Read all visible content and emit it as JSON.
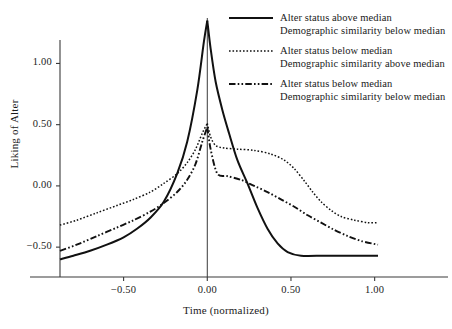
{
  "chart_data": {
    "type": "line",
    "title": "",
    "xlabel": "Time (normalized)",
    "ylabel": "Liking of Alter",
    "xlim": [
      -0.88,
      1.02
    ],
    "ylim": [
      -0.85,
      1.42
    ],
    "xticks": [
      -0.5,
      0.0,
      0.5,
      1.0
    ],
    "xticklabels": [
      "−0.50",
      "0.00",
      "0.50",
      "1.00"
    ],
    "yticks": [
      1.0,
      0.5,
      0.0,
      -0.5
    ],
    "yticklabels": [
      "1.00",
      "0.50",
      "0.00",
      "−0.50"
    ],
    "grid": false,
    "legend_position": "top-right",
    "vertical_reference_line_x": 0.0,
    "series": [
      {
        "name": "Alter status above median / Demographic similarity below median",
        "style": "solid",
        "legend_line1": "Alter status above median",
        "legend_line2": "Demographic  similarity below median",
        "x": [
          -0.88,
          -0.8,
          -0.7,
          -0.6,
          -0.5,
          -0.42,
          -0.34,
          -0.26,
          -0.18,
          -0.12,
          -0.06,
          -0.02,
          0.0,
          0.02,
          0.05,
          0.09,
          0.13,
          0.18,
          0.24,
          0.3,
          0.36,
          0.42,
          0.48,
          0.56,
          0.7,
          0.85,
          1.02
        ],
        "y": [
          -0.6,
          -0.57,
          -0.53,
          -0.48,
          -0.42,
          -0.35,
          -0.26,
          -0.13,
          0.1,
          0.36,
          0.78,
          1.18,
          1.35,
          1.12,
          0.85,
          0.62,
          0.43,
          0.21,
          0.02,
          -0.18,
          -0.35,
          -0.47,
          -0.54,
          -0.57,
          -0.57,
          -0.57,
          -0.57
        ]
      },
      {
        "name": "Alter status below median / Demographic similarity above median",
        "style": "dotted",
        "legend_line1": "Alter status below median",
        "legend_line2": "Demographic  similarity above median",
        "x": [
          -0.88,
          -0.78,
          -0.66,
          -0.54,
          -0.44,
          -0.34,
          -0.26,
          -0.18,
          -0.12,
          -0.07,
          -0.03,
          0.0,
          0.02,
          0.05,
          0.1,
          0.18,
          0.28,
          0.38,
          0.46,
          0.52,
          0.58,
          0.63,
          0.68,
          0.74,
          0.8,
          0.88,
          0.96,
          1.02
        ],
        "y": [
          -0.32,
          -0.28,
          -0.22,
          -0.16,
          -0.11,
          -0.05,
          0.02,
          0.1,
          0.19,
          0.3,
          0.43,
          0.51,
          0.4,
          0.33,
          0.31,
          0.3,
          0.29,
          0.26,
          0.21,
          0.14,
          0.04,
          -0.05,
          -0.13,
          -0.2,
          -0.25,
          -0.28,
          -0.3,
          -0.3
        ]
      },
      {
        "name": "Alter status below median / Demographic similarity below median",
        "style": "dashdot",
        "legend_line1": "Alter status below median",
        "legend_line2": "Demographic  similarity below median",
        "x": [
          -0.88,
          -0.78,
          -0.66,
          -0.54,
          -0.44,
          -0.34,
          -0.26,
          -0.18,
          -0.12,
          -0.07,
          -0.03,
          0.0,
          0.02,
          0.06,
          0.12,
          0.2,
          0.28,
          0.36,
          0.44,
          0.52,
          0.6,
          0.68,
          0.76,
          0.84,
          0.92,
          1.02
        ],
        "y": [
          -0.53,
          -0.48,
          -0.41,
          -0.34,
          -0.28,
          -0.21,
          -0.14,
          -0.05,
          0.05,
          0.18,
          0.36,
          0.48,
          0.3,
          0.1,
          0.08,
          0.05,
          0.0,
          -0.05,
          -0.11,
          -0.17,
          -0.24,
          -0.3,
          -0.36,
          -0.41,
          -0.45,
          -0.48
        ]
      }
    ]
  }
}
